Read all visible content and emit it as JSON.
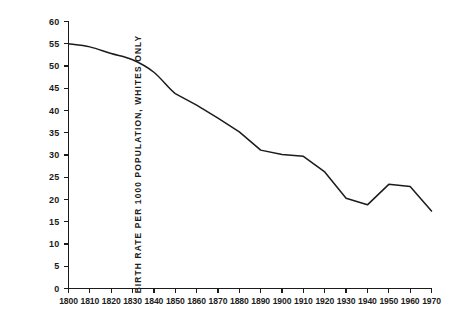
{
  "chart_data": {
    "type": "line",
    "title": "",
    "subtitle": "",
    "xlabel": "",
    "ylabel": "BIRTH RATE PER 1000 POPULATION, WHITES ONLY",
    "x": [
      1800,
      1810,
      1820,
      1830,
      1840,
      1850,
      1860,
      1870,
      1880,
      1890,
      1900,
      1910,
      1920,
      1930,
      1940,
      1950,
      1960,
      1970
    ],
    "values": [
      55.0,
      54.3,
      52.8,
      51.4,
      48.6,
      43.8,
      41.2,
      38.3,
      35.2,
      31.1,
      30.1,
      29.7,
      26.2,
      20.3,
      18.8,
      23.4,
      22.9,
      17.4
    ],
    "series": [
      {
        "name": "Birth rate per 1000 population, whites only",
        "values": [
          55.0,
          54.3,
          52.8,
          51.4,
          48.6,
          43.8,
          41.2,
          38.3,
          35.2,
          31.1,
          30.1,
          29.7,
          26.2,
          20.3,
          18.8,
          23.4,
          22.9,
          17.4
        ]
      }
    ],
    "xlim": [
      1800,
      1970
    ],
    "ylim": [
      0,
      60
    ],
    "ytick_values": [
      0,
      5,
      10,
      15,
      20,
      25,
      30,
      35,
      40,
      45,
      50,
      55,
      60
    ],
    "ytick_labels": [
      "0",
      "5",
      "10",
      "15",
      "20",
      "25",
      "30",
      "35",
      "40",
      "45",
      "50",
      "55",
      "60"
    ],
    "xtick_values": [
      1800,
      1810,
      1820,
      1830,
      1840,
      1850,
      1860,
      1870,
      1880,
      1890,
      1900,
      1910,
      1920,
      1930,
      1940,
      1950,
      1960,
      1970
    ],
    "xtick_labels": [
      "1800",
      "1810",
      "1820",
      "1830",
      "1840",
      "1850",
      "1860",
      "1870",
      "1880",
      "1890",
      "1900",
      "1910",
      "1920",
      "1930",
      "1940",
      "1950",
      "1960",
      "1970"
    ],
    "grid": false,
    "legend": false,
    "legend_position": "none",
    "line_color": "#1b1b1b",
    "axis_color": "#1b1b1b",
    "background_color": "#ffffff",
    "annotations": []
  },
  "figure": {
    "xlabel_text": ""
  }
}
